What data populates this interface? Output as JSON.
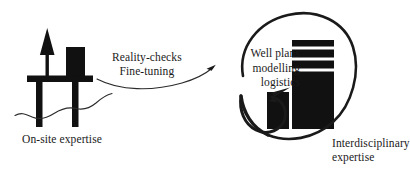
{
  "figure": {
    "background_color": "#ffffff",
    "ink_color": "#1a1a1a"
  },
  "labels": {
    "onsite": "On-site expertise",
    "flow_line1": "Reality-checks",
    "flow_line2": "Fine-tuning",
    "capability_line1": "Well plans",
    "capability_line2": "modelling",
    "capability_line3": "logistics",
    "interdisciplinary_line1": "Interdisciplinary",
    "interdisciplinary_line2": "expertise"
  },
  "icons": {
    "offshore_rig": "offshore-oil-rig-icon",
    "sea_wave": "sea-wave-icon",
    "derrick": "derrick-tower-icon",
    "rig_module": "rig-module-icon",
    "office_tower": "office-tower-icon",
    "office_annex": "office-annex-icon",
    "connector_arrow": "curved-connector-arrow-icon",
    "cycle_arrow": "elliptical-cycle-arrow-icon"
  },
  "colors": {
    "ink": "#1a1a1a",
    "structure_fill": "#111111",
    "wave_stroke": "#2b2b2b",
    "background": "#ffffff"
  }
}
